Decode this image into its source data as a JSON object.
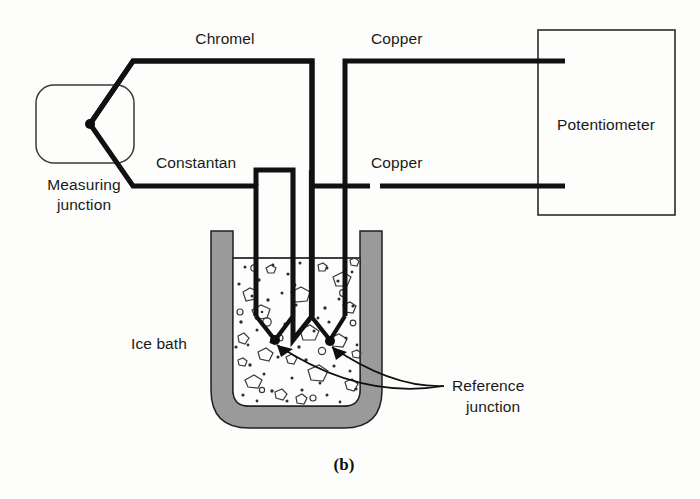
{
  "figure": {
    "caption": "(b)",
    "background_color": "#fdfdfc",
    "line_color": "#111111",
    "beaker_wall_color": "#9a9a9a"
  },
  "labels": {
    "chromel": "Chromel",
    "constantan": "Constantan",
    "copper_top": "Copper",
    "copper_bottom": "Copper",
    "potentiometer": "Potentiometer",
    "measuring_junction_line1": "Measuring",
    "measuring_junction_line2": "junction",
    "ice_bath": "Ice bath",
    "reference_junction_line1": "Reference",
    "reference_junction_line2": "junction"
  },
  "components": {
    "measuring_junction": {
      "name": "Measuring junction",
      "shape": "rounded-rectangle"
    },
    "potentiometer": {
      "name": "Potentiometer",
      "shape": "rectangle"
    },
    "ice_bath": {
      "name": "Ice bath",
      "shape": "beaker"
    },
    "reference_junctions": {
      "name": "Reference junction",
      "count": 2
    }
  },
  "wires": [
    {
      "name": "chromel",
      "material": "Chromel",
      "label": "Chromel"
    },
    {
      "name": "constantan",
      "material": "Constantan",
      "label": "Constantan"
    },
    {
      "name": "copper-upper",
      "material": "Copper",
      "label": "Copper"
    },
    {
      "name": "copper-lower",
      "material": "Copper",
      "label": "Copper"
    }
  ]
}
